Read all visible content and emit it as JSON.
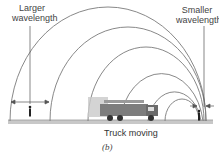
{
  "labels": {
    "left": [
      "Larger",
      "wavelength"
    ],
    "right": [
      "Smaller",
      "wavelength"
    ],
    "caption": "Truck moving",
    "panel": "(b)"
  },
  "colors": {
    "wave": "#7a7a7a",
    "ground": "#b5b5b5",
    "truck": "#5a5a5a",
    "text": "#444444"
  }
}
